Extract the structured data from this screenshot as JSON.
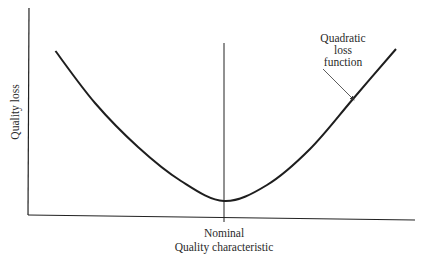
{
  "chart_data": {
    "type": "line",
    "title": "",
    "xlabel": "Quality characteristic",
    "ylabel": "Quality loss",
    "x_tick_labels": [
      "Nominal"
    ],
    "nominal_x": 0,
    "xlim": [
      -1,
      1
    ],
    "ylim": [
      0,
      1
    ],
    "series": [
      {
        "name": "Quadratic loss function",
        "function": "y = k * (x - nominal)^2 + y0",
        "x": [
          -0.98,
          -0.75,
          -0.5,
          -0.25,
          0,
          0.25,
          0.5,
          0.75,
          1.0
        ],
        "y": [
          0.82,
          0.56,
          0.34,
          0.17,
          0.07,
          0.15,
          0.33,
          0.58,
          0.83
        ]
      }
    ],
    "annotations": [
      {
        "text": [
          "Quadratic",
          "loss",
          "function"
        ],
        "points_to": "curve",
        "position": "top-right"
      }
    ],
    "grid": false,
    "line_color": "#1e1e1e"
  }
}
